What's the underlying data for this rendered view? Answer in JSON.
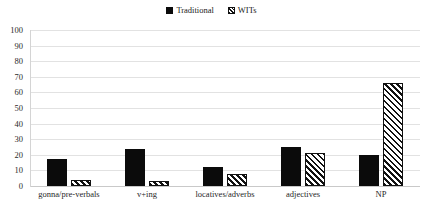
{
  "chart_data": {
    "type": "bar",
    "title": "",
    "subtitle": "",
    "xlabel": "",
    "ylabel": "",
    "ylim": [
      0,
      100
    ],
    "ytick_labels": [
      "100",
      "90",
      "80",
      "70",
      "60",
      "50",
      "40",
      "30",
      "20",
      "10",
      "0"
    ],
    "ytick_values": [
      100,
      90,
      80,
      70,
      60,
      50,
      40,
      30,
      20,
      10,
      0
    ],
    "grid": true,
    "grid_axis": "y",
    "legend_position": "top-center",
    "categories": [
      "gonna/pre-verbals",
      "v+ing",
      "locatives/adverbs",
      "adjectives",
      "NP"
    ],
    "series": [
      {
        "name": "Traditional",
        "swatch": "solid",
        "color": "#0b0b0b",
        "values": [
          17,
          24,
          12,
          25,
          20
        ]
      },
      {
        "name": "WITs",
        "swatch": "hatch",
        "color": "#111111",
        "values": [
          4,
          3,
          8,
          21,
          66
        ]
      }
    ]
  },
  "legend": {
    "entries": [
      {
        "label": "Traditional",
        "swatch": "solid-square-icon"
      },
      {
        "label": "WITs",
        "swatch": "hatched-square-icon"
      }
    ]
  }
}
